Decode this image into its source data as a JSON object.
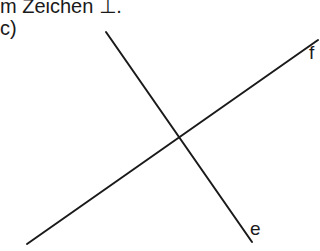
{
  "header": {
    "text": "m Zeichen ⊥."
  },
  "task": {
    "label": "c)"
  },
  "diagram": {
    "lines": [
      {
        "name": "e",
        "x1": 106,
        "y1": 32,
        "x2": 252,
        "y2": 242,
        "label": "e",
        "label_x": 250,
        "label_y": 219
      },
      {
        "name": "f",
        "x1": 27,
        "y1": 244,
        "x2": 318,
        "y2": 40,
        "label": "f",
        "label_x": 309,
        "label_y": 43
      }
    ],
    "stroke_color": "#1a1a1a",
    "stroke_width": 2
  }
}
